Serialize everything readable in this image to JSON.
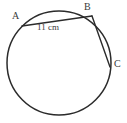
{
  "figure": {
    "type": "circle-with-chords",
    "background_color": "#ffffff",
    "stroke_color": "#2b2b2b",
    "text_color": "#3a3a3a",
    "circle": {
      "center_x": 59,
      "center_y": 63,
      "radius": 52
    },
    "points": [
      {
        "id": "A",
        "label": "A",
        "x": 22,
        "y": 26
      },
      {
        "id": "B",
        "label": "B",
        "x": 92,
        "y": 16
      },
      {
        "id": "C",
        "label": "C",
        "x": 110,
        "y": 67
      }
    ],
    "chords": [
      {
        "id": "AB",
        "from": "A",
        "to": "B",
        "label": "11 cm",
        "length_value": "11",
        "length_unit": "cm"
      },
      {
        "id": "BC",
        "from": "B",
        "to": "C",
        "label": ""
      }
    ],
    "labels": {
      "a": "A",
      "b": "B",
      "c": "C",
      "chord_ab_measure": "11 cm"
    }
  }
}
